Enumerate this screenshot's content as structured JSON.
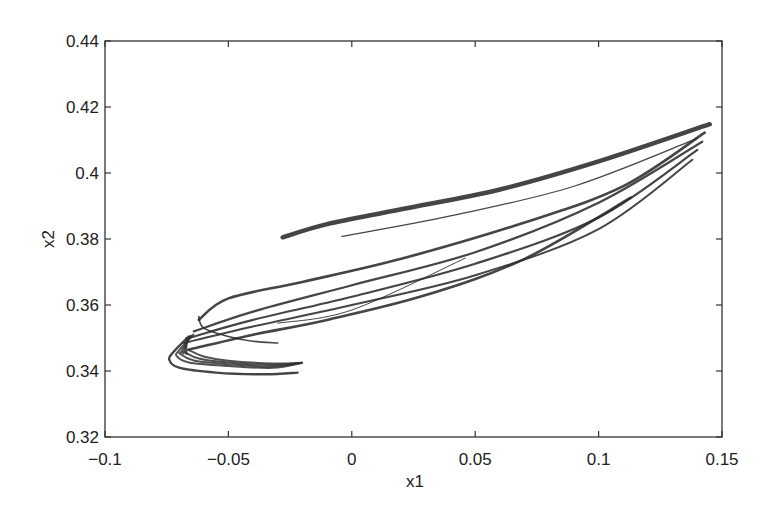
{
  "chart_data": {
    "type": "line",
    "title": "",
    "xlabel": "x1",
    "ylabel": "x2",
    "xlim": [
      -0.1,
      0.15
    ],
    "ylim": [
      0.32,
      0.44
    ],
    "grid": false,
    "legend": null,
    "xticks": [
      -0.1,
      -0.05,
      0,
      0.05,
      0.1,
      0.15
    ],
    "xtick_labels": [
      "-0.1",
      "-0.05",
      "0",
      "0.05",
      "0.1",
      "0.15"
    ],
    "yticks": [
      0.32,
      0.34,
      0.36,
      0.38,
      0.4,
      0.42,
      0.44
    ],
    "ytick_labels": [
      "0.32",
      "0.34",
      "0.36",
      "0.38",
      "0.4",
      "0.42",
      "0.44"
    ],
    "series": [
      {
        "name": "upper band",
        "stroke_width": 4.5,
        "points": [
          [
            -0.028,
            0.3805
          ],
          [
            -0.01,
            0.3845
          ],
          [
            0.02,
            0.389
          ],
          [
            0.06,
            0.395
          ],
          [
            0.1,
            0.4035
          ],
          [
            0.145,
            0.4148
          ]
        ]
      },
      {
        "name": "upper thin line",
        "stroke_width": 1.2,
        "points": [
          [
            -0.004,
            0.3808
          ],
          [
            0.04,
            0.387
          ],
          [
            0.09,
            0.396
          ],
          [
            0.14,
            0.4105
          ]
        ]
      },
      {
        "name": "mid band 1",
        "stroke_width": 2.6,
        "points": [
          [
            -0.062,
            0.3555
          ],
          [
            -0.05,
            0.362
          ],
          [
            -0.02,
            0.367
          ],
          [
            0.02,
            0.374
          ],
          [
            0.07,
            0.385
          ],
          [
            0.11,
            0.396
          ],
          [
            0.143,
            0.4122
          ]
        ]
      },
      {
        "name": "mid band 2",
        "stroke_width": 2.2,
        "points": [
          [
            -0.064,
            0.352
          ],
          [
            -0.04,
            0.358
          ],
          [
            0.0,
            0.366
          ],
          [
            0.05,
            0.376
          ],
          [
            0.1,
            0.391
          ],
          [
            0.142,
            0.4095
          ]
        ]
      },
      {
        "name": "mid band 3",
        "stroke_width": 2.2,
        "points": [
          [
            -0.066,
            0.35
          ],
          [
            -0.04,
            0.3555
          ],
          [
            0.0,
            0.3625
          ],
          [
            0.05,
            0.3725
          ],
          [
            0.1,
            0.3865
          ],
          [
            0.14,
            0.407
          ]
        ]
      },
      {
        "name": "mid band 4",
        "stroke_width": 2.0,
        "points": [
          [
            -0.068,
            0.3485
          ],
          [
            -0.04,
            0.3535
          ],
          [
            0.0,
            0.36
          ],
          [
            0.05,
            0.369
          ],
          [
            0.1,
            0.383
          ],
          [
            0.138,
            0.404
          ]
        ]
      },
      {
        "name": "lower long curve",
        "stroke_width": 2.6,
        "points": [
          [
            -0.066,
            0.3465
          ],
          [
            -0.04,
            0.351
          ],
          [
            -0.01,
            0.3555
          ],
          [
            0.03,
            0.363
          ],
          [
            0.07,
            0.374
          ],
          [
            0.113,
            0.3925
          ]
        ]
      },
      {
        "name": "lower thin line",
        "stroke_width": 1.0,
        "points": [
          [
            -0.03,
            0.3545
          ],
          [
            0.0,
            0.3585
          ],
          [
            0.046,
            0.3742
          ]
        ]
      },
      {
        "name": "hook curve",
        "stroke_width": 1.6,
        "points": [
          [
            -0.062,
            0.3565
          ],
          [
            -0.06,
            0.353
          ],
          [
            -0.05,
            0.3505
          ],
          [
            -0.04,
            0.349
          ],
          [
            -0.03,
            0.3485
          ]
        ]
      },
      {
        "name": "left lobe loops",
        "stroke_width": 2.4,
        "points": [
          [
            -0.066,
            0.3505
          ],
          [
            -0.072,
            0.346
          ],
          [
            -0.074,
            0.3435
          ],
          [
            -0.07,
            0.341
          ],
          [
            -0.055,
            0.3395
          ],
          [
            -0.035,
            0.339
          ],
          [
            -0.022,
            0.3395
          ]
        ]
      }
    ]
  }
}
